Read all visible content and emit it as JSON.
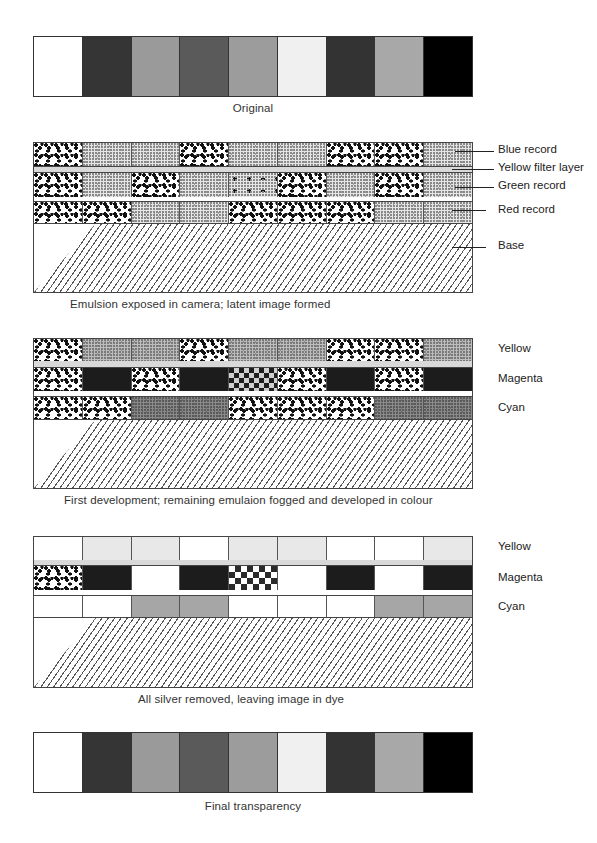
{
  "diagram": {
    "stages": [
      {
        "id": "original",
        "caption": "Original",
        "swatches": [
          "#ffffff",
          "#353535",
          "#9a9a9a",
          "#5a5a5a",
          "#9c9c9c",
          "#f0f0f0",
          "#333333",
          "#a8a8a8",
          "#000000"
        ]
      },
      {
        "id": "exposure",
        "caption": "Emulsion exposed in camera; latent image formed",
        "layers": [
          {
            "label": "Blue record",
            "cells": [
              "coarse",
              "fine",
              "fine",
              "coarse",
              "fine",
              "fine",
              "coarse",
              "coarse",
              "fine"
            ]
          },
          {
            "label": "Yellow filter layer"
          },
          {
            "label": "Green record",
            "cells": [
              "coarse",
              "fine",
              "coarse",
              "fine",
              "sparse",
              "coarse",
              "fine",
              "coarse",
              "fine"
            ]
          },
          {
            "label": "Red record",
            "cells": [
              "coarse",
              "coarse",
              "fine",
              "fine",
              "coarse",
              "coarse",
              "coarse",
              "fine",
              "fine"
            ]
          },
          {
            "label": "Base"
          }
        ]
      },
      {
        "id": "first-development",
        "caption": "First development; remaining emulaion fogged and developed in colour",
        "layers": [
          {
            "label": "Yellow",
            "cells": [
              "coarse",
              "fine-dark",
              "fine-dark",
              "coarse",
              "fine-dark",
              "fine-dark",
              "coarse",
              "coarse",
              "fine-dark"
            ]
          },
          {
            "label": "Magenta",
            "cells": [
              "coarse",
              "black",
              "coarse",
              "black",
              "checker-soft",
              "coarse",
              "black",
              "coarse",
              "black"
            ]
          },
          {
            "label": "Cyan",
            "cells": [
              "coarse",
              "coarse",
              "fine-darker",
              "fine-darker",
              "coarse",
              "coarse",
              "coarse",
              "fine-darker",
              "fine-darker"
            ]
          }
        ]
      },
      {
        "id": "silver-removed",
        "caption": "All silver removed, leaving image in dye",
        "layers": [
          {
            "label": "Yellow",
            "cells": [
              "white",
              "lightgray",
              "lightgray",
              "white",
              "lightgray",
              "lightgray",
              "white",
              "white",
              "lightgray"
            ]
          },
          {
            "label": "Magenta",
            "cells": [
              "coarse",
              "black",
              "white",
              "black",
              "checker",
              "white",
              "black",
              "white",
              "black"
            ]
          },
          {
            "label": "Cyan",
            "cells": [
              "white",
              "white",
              "gray",
              "gray",
              "white",
              "white",
              "white",
              "gray",
              "gray"
            ]
          }
        ]
      },
      {
        "id": "final",
        "caption": "Final transparency",
        "swatches": [
          "#ffffff",
          "#353535",
          "#9a9a9a",
          "#5a5a5a",
          "#9c9c9c",
          "#f0f0f0",
          "#333333",
          "#a8a8a8",
          "#000000"
        ]
      }
    ]
  }
}
